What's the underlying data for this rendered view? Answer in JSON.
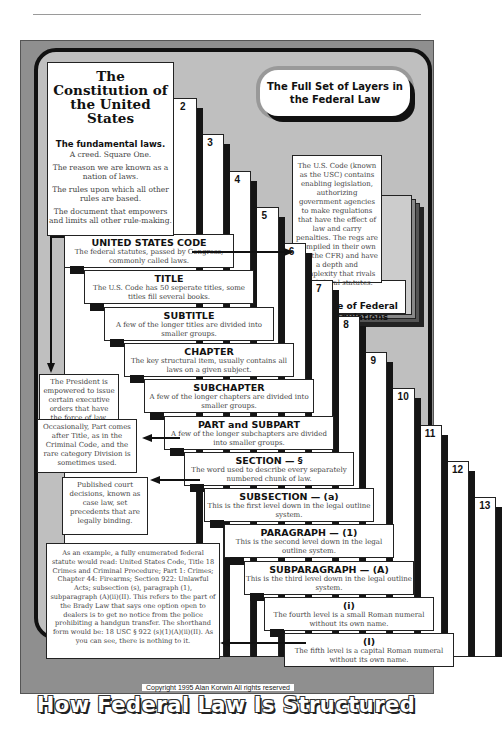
{
  "header_title": "The Full Set of Layers in the Federal Law",
  "footer": {
    "copyright": "Copyright 1995 Alan Korwin   All rights reserved",
    "title": "How Federal Law Is Structured"
  },
  "constitution": {
    "title_line1": "The Constitution of",
    "title_line2": "the United States",
    "bold": "The fundamental laws.",
    "lines": [
      "A creed.  Square One.",
      "The reason we are known as a nation of laws.",
      "The rules upon which all other rules are based.",
      "The document that empowers and limits all other rule-making."
    ]
  },
  "levels": [
    {
      "num": "2",
      "title": "UNITED STATES CODE",
      "desc": "The federal statutes, passed by Congress, commonly called laws."
    },
    {
      "num": "3",
      "title": "TITLE",
      "desc": "The U.S. Code has 50 seperate titles, some titles fill several books."
    },
    {
      "num": "4",
      "title": "SUBTITLE",
      "desc": "A few of the longer titles are divided into smaller groups."
    },
    {
      "num": "5",
      "title": "CHAPTER",
      "desc": "The key structural item, usually contains all laws on a given subject."
    },
    {
      "num": "6",
      "title": "SUBCHAPTER",
      "desc": "A few of the longer chapters are divided into smaller groups."
    },
    {
      "num": "7",
      "title": "PART and SUBPART",
      "desc": "A few of the longer subchapters are divided into smaller groups."
    },
    {
      "num": "8",
      "title": "SECTION — §",
      "desc": "The word used to describe every separately numbered chunk of law."
    },
    {
      "num": "9",
      "title": "SUBSECTION — (a)",
      "desc": "This is the first level down in the legal outline system."
    },
    {
      "num": "10",
      "title": "PARAGRAPH — (1)",
      "desc": "This is the second level down in the legal outline system."
    },
    {
      "num": "11",
      "title": "SUBPARAGRAPH — (A)",
      "desc": "This is the third level down in the legal outline system."
    },
    {
      "num": "12",
      "title": "(i)",
      "desc": "The fourth level is a small Roman numeral without its own name."
    },
    {
      "num": "13",
      "title": "(I)",
      "desc": "The fifth level is a capital Roman numeral without its own name."
    }
  ],
  "cfr": {
    "text": "The U.S. Code (known as the USC) contains enabling legislation, authorizing government agencies to make regulations that have the effect of law and carry penalties.  The regs are compiled in their own set (the CFR) and have a depth and complexity that rivals the federal statutes.",
    "label": "Code of Federal Regulations"
  },
  "notes": {
    "president": "The President is empowered to issue certain executive orders that have the force of law.",
    "part": "Occasionally, Part comes after Title, as in the Criminal Code, and the rare category Division is sometimes used.",
    "caselaw": "Published court decisions, known as case law, set precedents that are legally binding.",
    "example": "As an example, a fully enumerated federal statute would read:  United States Code, Title 18 Crimes and Criminal Procedure; Part 1: Crimes; Chapter 44: Firearms; Section 922: Unlawful Acts; subsection (s), paragraph (1), subparagraph (A)(ii)(II). This refers to the part of the Brady Law that says one option open to dealers is to get no notice from the police prohibiting a handgun transfer. The shorthand form would be: 18 USC § 922 (s)(1)(A)(ii)(II). As you can see, there is nothing to it."
  },
  "colors": {
    "frame": "#8f8f8f",
    "panel": "#bfbfbf",
    "ink": "#111111"
  }
}
